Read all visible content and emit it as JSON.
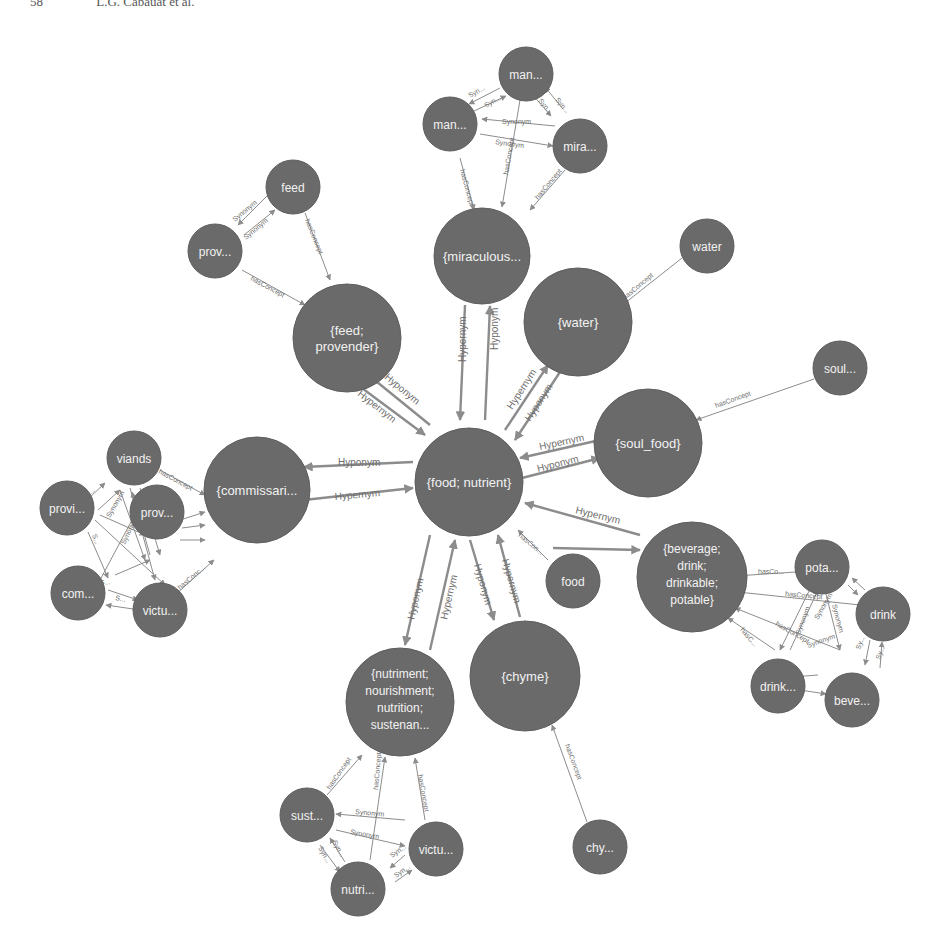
{
  "header": {
    "page_number": "58",
    "authors": "L.G. Cabauat et al."
  },
  "graph": {
    "center": {
      "id": "food_nutrient",
      "label": "{food; nutrient}"
    },
    "synsets": [
      {
        "id": "miraculous",
        "label": "{miraculous..."
      },
      {
        "id": "feed_provender",
        "label_lines": [
          "{feed;",
          "provender}"
        ]
      },
      {
        "id": "water",
        "label": "{water}"
      },
      {
        "id": "soul_food",
        "label": "{soul_food}"
      },
      {
        "id": "commissary",
        "label": "{commissari..."
      },
      {
        "id": "beverage",
        "label_lines": [
          "{beverage;",
          "drink;",
          "drinkable;",
          "potable}"
        ]
      },
      {
        "id": "nutriment",
        "label_lines": [
          "{nutriment;",
          "nourishment;",
          "nutrition;",
          "sustenan..."
        ]
      },
      {
        "id": "chyme",
        "label": "{chyme}"
      }
    ],
    "words": [
      {
        "id": "man1",
        "label": "man..."
      },
      {
        "id": "man2",
        "label": "man..."
      },
      {
        "id": "mira",
        "label": "mira..."
      },
      {
        "id": "feed",
        "label": "feed"
      },
      {
        "id": "prov1",
        "label": "prov..."
      },
      {
        "id": "water_w",
        "label": "water"
      },
      {
        "id": "soul",
        "label": "soul..."
      },
      {
        "id": "viands",
        "label": "viands"
      },
      {
        "id": "provi",
        "label": "provi..."
      },
      {
        "id": "prov2",
        "label": "prov..."
      },
      {
        "id": "com",
        "label": "com..."
      },
      {
        "id": "victu1",
        "label": "victu..."
      },
      {
        "id": "food_w",
        "label": "food"
      },
      {
        "id": "pota",
        "label": "pota..."
      },
      {
        "id": "drink1",
        "label": "drink"
      },
      {
        "id": "drink2",
        "label": "drink..."
      },
      {
        "id": "beve",
        "label": "beve..."
      },
      {
        "id": "sust",
        "label": "sust..."
      },
      {
        "id": "victu2",
        "label": "victu..."
      },
      {
        "id": "nutri",
        "label": "nutri..."
      },
      {
        "id": "chy",
        "label": "chy..."
      }
    ],
    "edge_labels": {
      "hyponym": "Hyponym",
      "hypernym": "Hypernym",
      "has_concept": "hasConcept",
      "has_concept_short": "hasCo...",
      "has_concept_short2": "hasC...",
      "has_con": "hasCon...",
      "has_conc": "hasConc...",
      "synonym": "Synonym",
      "syn_short": "Syn...",
      "s_short": "S...",
      "sy_short": "Sy..."
    }
  }
}
